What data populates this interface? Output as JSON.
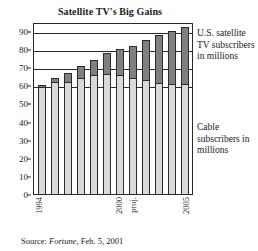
{
  "chart_data": {
    "type": "bar",
    "subtype": "stacked-bar",
    "title": "Satellite TV's Big Gains",
    "xlabel": "",
    "ylabel": "",
    "ylim": [
      0,
      95
    ],
    "yticks": [
      0,
      10,
      20,
      30,
      40,
      50,
      60,
      70,
      80,
      90
    ],
    "grid": true,
    "gridlines_at": [
      60,
      70,
      80,
      90
    ],
    "legend_position": "right",
    "categories": [
      "1994",
      "1995",
      "1996",
      "1997",
      "1998",
      "1999",
      "2000",
      "proj.",
      "2002",
      "2003",
      "2004",
      "2005"
    ],
    "xtick_labels": [
      {
        "index": 0,
        "label": "1994"
      },
      {
        "index": 6,
        "label": "2000"
      },
      {
        "index": 7,
        "label": "proj."
      },
      {
        "index": 11,
        "label": "2005"
      }
    ],
    "series": [
      {
        "name": "Cable subscribers in millions",
        "color": "#d9d9d9",
        "values": [
          59,
          62,
          62,
          64,
          65.5,
          66.5,
          65.5,
          64,
          63,
          61.5,
          61,
          60.5
        ]
      },
      {
        "name": "U.S. satellite TV subscribers in millions",
        "color": "#808080",
        "values": [
          1,
          2,
          5,
          6.5,
          8.5,
          11.5,
          14.5,
          18,
          22,
          26.5,
          29,
          31.5
        ]
      }
    ],
    "totals": [
      60,
      64,
      67,
      70.5,
      74,
      78,
      80,
      82,
      85,
      88,
      90,
      92
    ]
  },
  "legend": {
    "satellite": "U.S. satellite TV subscribers in millions",
    "cable": "Cable subscribers in millions"
  },
  "source": {
    "prefix": "Source: ",
    "publication": "Fortune",
    "suffix": ", Feb. 5, 2001"
  }
}
